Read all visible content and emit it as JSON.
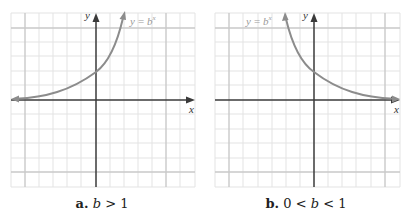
{
  "panels": [
    {
      "id": "a",
      "caption": {
        "letter": "a.",
        "condition_var": "b",
        "condition": "> 1"
      },
      "curve_label": {
        "lhs": "y",
        "eq": "=",
        "base": "b",
        "exp": "x"
      },
      "x_axis_label": "x",
      "y_axis_label": "y",
      "behavior": "increasing"
    },
    {
      "id": "b",
      "caption": {
        "letter": "b.",
        "prefix": "0 <",
        "condition_var": "b",
        "condition": "< 1"
      },
      "curve_label": {
        "lhs": "y",
        "eq": "=",
        "base": "b",
        "exp": "x"
      },
      "x_axis_label": "x",
      "y_axis_label": "y",
      "behavior": "decreasing"
    }
  ],
  "colors": {
    "grid_light": "#e2e2e2",
    "grid_dark": "#c8c8c8",
    "axis": "#3a3a3a",
    "curve": "#8a8a8a",
    "label": "#9a9a9a"
  }
}
